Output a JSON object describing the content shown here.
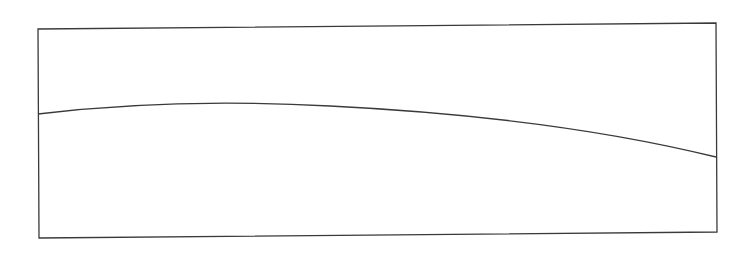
{
  "diagram": {
    "stroke_color": "#3a3a3a",
    "background": "#ffffff",
    "frame": {
      "points": "38,29 716,23 717,232 39,238",
      "stroke_width": 1.3
    },
    "curve": {
      "path": "M38,114 C120,104 220,100 330,106 C450,112 590,126 716,157",
      "stroke_width": 1.3
    }
  }
}
